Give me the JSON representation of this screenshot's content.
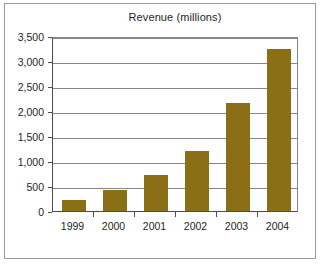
{
  "figure": {
    "background_color": "#ffffff",
    "frame_color": "#9a9a9a",
    "axis_color": "#4d4d4d",
    "gridline_color": "#86868a",
    "bar_color": "#8a6f16",
    "text_color": "#231f20"
  },
  "chart_data": {
    "type": "bar",
    "title": "Revenue (millions)",
    "xlabel": "",
    "ylabel": "",
    "categories": [
      "1999",
      "2000",
      "2001",
      "2002",
      "2003",
      "2004"
    ],
    "values": [
      230,
      430,
      730,
      1210,
      2170,
      3250
    ],
    "ylim": [
      0,
      3500
    ],
    "yticks": [
      0,
      500,
      1000,
      1500,
      2000,
      2500,
      3000,
      3500
    ],
    "ytick_labels": [
      "0",
      "500",
      "1,000",
      "1,500",
      "2,000",
      "2,500",
      "3,000",
      "3,500"
    ],
    "grid": true,
    "grid_axis": "y",
    "legend": null,
    "legend_position": "none",
    "series": [
      {
        "name": "Revenue",
        "color": "#8a6f16",
        "values": [
          230,
          430,
          730,
          1210,
          2170,
          3250
        ]
      }
    ]
  }
}
